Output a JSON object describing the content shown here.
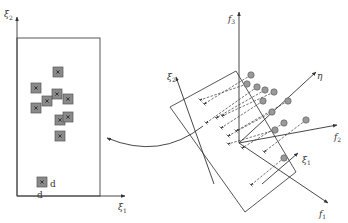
{
  "left_panel": {
    "y_axis_label": "ξ",
    "y_axis_sub": "2",
    "x_axis_label": "ξ",
    "x_axis_sub": "1",
    "box_color": "#444444",
    "marker_fill": "#8a8a8a",
    "markers": [
      {
        "x": 58,
        "y": 72
      },
      {
        "x": 36,
        "y": 88
      },
      {
        "x": 57,
        "y": 94
      },
      {
        "x": 47,
        "y": 101
      },
      {
        "x": 68,
        "y": 99
      },
      {
        "x": 36,
        "y": 108
      },
      {
        "x": 60,
        "y": 120
      },
      {
        "x": 68,
        "y": 117
      },
      {
        "x": 60,
        "y": 136
      },
      {
        "x": 42,
        "y": 182
      }
    ],
    "point_label_right": "d",
    "point_label_below": "d"
  },
  "right_panel": {
    "f3_label": "f",
    "f3_sub": "3",
    "f2_label": "f",
    "f2_sub": "2",
    "f1_label": "f",
    "f1_sub": "1",
    "eta_label": "η",
    "xi1_label": "ξ",
    "xi1_sub": "1",
    "xi2_label": "ξ",
    "xi2_sub": "2",
    "circle_fill": "#999999"
  },
  "arrow": {
    "description": "curved mapping arrow from projection plane to 2D feature space"
  }
}
